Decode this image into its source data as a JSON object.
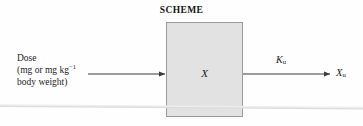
{
  "figure": {
    "title": "SCHEME",
    "type": "pharmacokinetic-compartment-scheme"
  },
  "dose_label": {
    "line1": "Dose",
    "line2_prefix": "(mg or mg kg",
    "line2_superscript": "−1",
    "line3": "body weight)"
  },
  "compartment": {
    "label": "X"
  },
  "rate_constant": {
    "symbol": "K",
    "subscript": "u"
  },
  "output": {
    "symbol": "X",
    "subscript": "u"
  },
  "colors": {
    "box_fill": "#e2e2e2",
    "box_border": "#9a9a9a",
    "arrow": "#3a3a3a",
    "text": "#1c1c1c",
    "background": "#fefefe",
    "fold_line": "#d7d7d7"
  }
}
